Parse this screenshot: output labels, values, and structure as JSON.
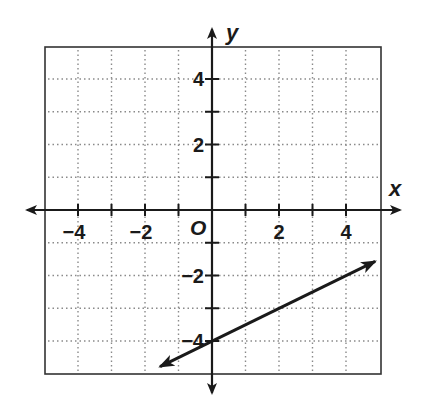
{
  "chart_data": {
    "type": "line",
    "title": "",
    "xlabel": "x",
    "ylabel": "y",
    "origin_label": "O",
    "xlim": [
      -5,
      5
    ],
    "ylim": [
      -5,
      5
    ],
    "grid": true,
    "grid_style": "dotted",
    "x_ticks": [
      -4,
      -3,
      -2,
      -1,
      1,
      2,
      3,
      4
    ],
    "y_ticks": [
      -4,
      -3,
      -2,
      -1,
      1,
      2,
      3,
      4
    ],
    "x_tick_labels": [
      "−4",
      "−2",
      "2",
      "4"
    ],
    "y_tick_labels": [
      "4",
      "2",
      "−2",
      "−4"
    ],
    "series": [
      {
        "name": "line",
        "equation": "y = 0.5x - 4",
        "slope": 0.5,
        "y_intercept": -4,
        "x": [
          -1.55,
          0,
          4.87
        ],
        "y": [
          -4.78,
          -4,
          -1.57
        ],
        "arrows": "both"
      }
    ]
  }
}
